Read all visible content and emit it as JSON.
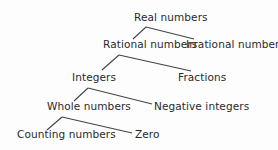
{
  "diagram": {
    "type": "hierarchy-tree",
    "nodes": {
      "real": "Real numbers",
      "rational": "Rational numbers",
      "irrational": "Irrational numbers",
      "integers": "Integers",
      "fractions": "Fractions",
      "whole": "Whole numbers",
      "negative": "Negative integers",
      "counting": "Counting numbers",
      "zero": "Zero"
    },
    "edges": [
      [
        "Real numbers",
        "Rational numbers"
      ],
      [
        "Real numbers",
        "Irrational numbers"
      ],
      [
        "Rational numbers",
        "Integers"
      ],
      [
        "Rational numbers",
        "Fractions"
      ],
      [
        "Integers",
        "Whole numbers"
      ],
      [
        "Integers",
        "Negative integers"
      ],
      [
        "Whole numbers",
        "Counting numbers"
      ],
      [
        "Whole numbers",
        "Zero"
      ]
    ]
  }
}
